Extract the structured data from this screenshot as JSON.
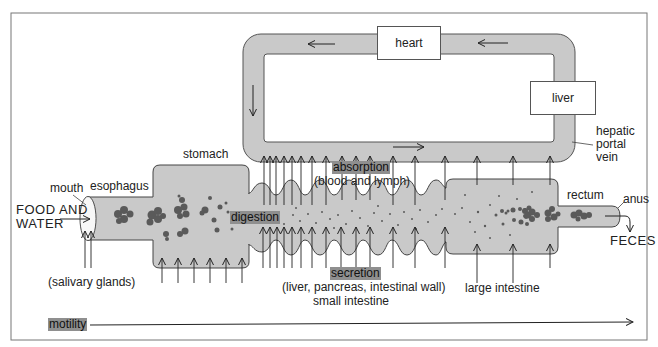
{
  "diagram": {
    "organs": {
      "heart": "heart",
      "liver": "liver",
      "hepatic_portal_vein": [
        "hepatic",
        "portal",
        "vein"
      ],
      "stomach": "stomach",
      "mouth": "mouth",
      "esophagus": "esophagus",
      "rectum": "rectum",
      "anus": "anus",
      "salivary_glands": "(salivary glands)",
      "large_intestine": "large intestine",
      "small_intestine": "small intestine"
    },
    "inputs": {
      "food_line1": "FOOD AND",
      "food_line2": "WATER"
    },
    "outputs": {
      "feces": "FECES"
    },
    "processes": {
      "absorption": "absorption",
      "absorption_detail": "(blood and lymph)",
      "digestion": "digestion",
      "secretion": "secretion",
      "secretion_detail": "(liver, pancreas, intestinal wall)",
      "motility": "motility"
    },
    "colors": {
      "tube_fill": "#c9c9c9",
      "highlight": "#8f8f8f",
      "food_particles": "#5a5a5a",
      "stroke": "#333333"
    }
  }
}
